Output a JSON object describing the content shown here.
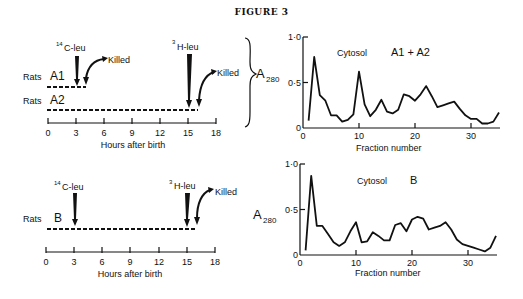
{
  "figure": {
    "title": "FIGURE 3"
  },
  "timelines": [
    {
      "id": "A",
      "xlabel": "Hours after birth",
      "ticks": [
        "0",
        "3",
        "6",
        "9",
        "12",
        "15",
        "18"
      ],
      "groups": [
        {
          "label_prefix": "Rats",
          "label": "A1",
          "start_h": 0,
          "end_h": 4
        },
        {
          "label_prefix": "Rats",
          "label": "A2",
          "start_h": 0,
          "end_h": 16
        }
      ],
      "annotations": {
        "c14_label_sup": "14",
        "c14_label": "C-leu",
        "c14_time_h": 3,
        "h3_label_sup": "3",
        "h3_label": "H-leu",
        "h3_time_h": 15,
        "killed_label_1": "Killed",
        "killed_time_1_h": 4,
        "killed_label_2": "Killed",
        "killed_time_2_h": 16
      }
    },
    {
      "id": "B",
      "xlabel": "Hours after birth",
      "ticks": [
        "0",
        "3",
        "6",
        "9",
        "12",
        "15",
        "18"
      ],
      "groups": [
        {
          "label_prefix": "Rats",
          "label": "B",
          "start_h": 0,
          "end_h": 16
        }
      ],
      "annotations": {
        "c14_label_sup": "14",
        "c14_label": "C-leu",
        "c14_time_h": 3,
        "h3_label_sup": "3",
        "h3_label": "H-leu",
        "h3_time_h": 15,
        "killed_label": "Killed",
        "killed_time_h": 16
      }
    }
  ],
  "chart_data": [
    {
      "type": "line",
      "title": "Cytosol A1 + A2",
      "title_prefix": "Cytosol",
      "title_suffix": "A1 + A2",
      "xlabel": "Fraction number",
      "ylabel": "A280",
      "ylabel_main": "A",
      "ylabel_sub": "280",
      "xlim": [
        0,
        35
      ],
      "ylim": [
        0,
        1.0
      ],
      "xticks": [
        "0",
        "10",
        "20",
        "30"
      ],
      "yticks": [
        "0",
        "0·5",
        "1·0"
      ],
      "grid": false,
      "x": [
        1,
        2,
        3,
        4,
        5,
        6,
        7,
        8,
        9,
        10,
        11,
        12,
        13,
        14,
        15,
        16,
        17,
        18,
        19,
        20,
        21,
        22,
        23,
        24,
        25,
        26,
        27,
        28,
        29,
        30,
        31,
        32,
        33,
        34,
        35
      ],
      "values": [
        0.08,
        0.78,
        0.36,
        0.3,
        0.14,
        0.14,
        0.07,
        0.09,
        0.15,
        0.62,
        0.26,
        0.13,
        0.2,
        0.31,
        0.18,
        0.16,
        0.2,
        0.37,
        0.35,
        0.3,
        0.37,
        0.46,
        0.35,
        0.23,
        0.25,
        0.27,
        0.29,
        0.21,
        0.14,
        0.1,
        0.1,
        0.05,
        0.05,
        0.07,
        0.17
      ]
    },
    {
      "type": "line",
      "title": "Cytosol B",
      "title_prefix": "Cytosol",
      "title_suffix": "B",
      "xlabel": "Fraction number",
      "ylabel": "A280",
      "ylabel_main": "A",
      "ylabel_sub": "280",
      "xlim": [
        0,
        35
      ],
      "ylim": [
        0,
        1.0
      ],
      "xticks": [
        "0",
        "10",
        "20",
        "30"
      ],
      "yticks": [
        "0",
        "0·5",
        "1·0"
      ],
      "grid": false,
      "x": [
        1,
        2,
        3,
        4,
        5,
        6,
        7,
        8,
        9,
        10,
        11,
        12,
        13,
        14,
        15,
        16,
        17,
        18,
        19,
        20,
        21,
        22,
        23,
        24,
        25,
        26,
        27,
        28,
        29,
        30,
        31,
        32,
        33,
        34,
        35
      ],
      "values": [
        0.05,
        0.87,
        0.32,
        0.32,
        0.23,
        0.14,
        0.1,
        0.14,
        0.26,
        0.36,
        0.14,
        0.15,
        0.25,
        0.21,
        0.16,
        0.16,
        0.33,
        0.35,
        0.26,
        0.39,
        0.42,
        0.4,
        0.28,
        0.3,
        0.32,
        0.36,
        0.28,
        0.17,
        0.12,
        0.1,
        0.08,
        0.06,
        0.04,
        0.08,
        0.21
      ]
    }
  ]
}
